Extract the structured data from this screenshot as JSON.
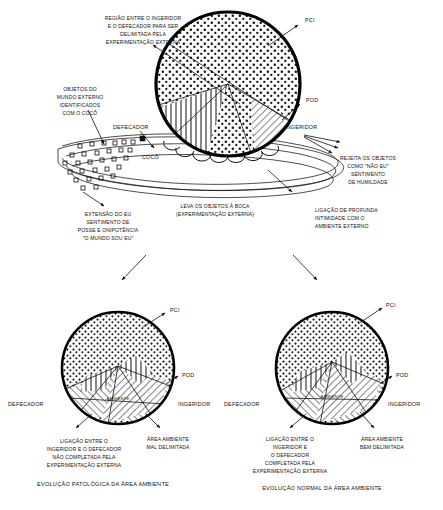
{
  "figure": {
    "title_top": "",
    "panels": [
      {
        "id": "top",
        "name": "top-diagram",
        "labels": {
          "pci": "PCI",
          "pod": "POD",
          "ingeridor": "INGERIDOR",
          "defecador": "DEFECADOR",
          "coco": "COCÔ"
        },
        "annotations": [
          {
            "id": "regiao-entre",
            "lines": [
              "REGIÃO ENTRE O INGERIDOR",
              "E O DEFECADOR PARA SER",
              "DELIMITADA PELA",
              "EXPERIMENTAÇÃO EXTERNA"
            ]
          },
          {
            "id": "objetos-mundo-externo",
            "lines": [
              "OBJETOS DO",
              "MUNDO EXTERNO",
              "IDENTIFICADOS",
              "COM O COCÔ"
            ]
          },
          {
            "id": "rejeita-objetos",
            "lines": [
              "REJEITA OS OBJETOS",
              "COMO \"NÃO EU\"",
              "SENTIMENTO",
              "DE HUMILDADE"
            ]
          },
          {
            "id": "extensao-do-eu",
            "lines": [
              "EXTENSÃO DO EU",
              "SENTIMENTO DE",
              "POSSE E ONIPOTÊNCIA",
              "\"O MUNDO SOU EU\""
            ]
          },
          {
            "id": "leva-objetos-boca",
            "lines": [
              "LEVA OS OBJETOS À BOCA",
              "(EXPERIMENTAÇÃO EXTERNA)"
            ]
          },
          {
            "id": "ligacao-profunda",
            "lines": [
              "LIGAÇÃO DE PROFUNDA",
              "INTIMIDADE COM O",
              "AMBIENTE EXTERNO"
            ]
          }
        ]
      },
      {
        "id": "bottom-left",
        "name": "pathological-diagram",
        "labels": {
          "pci": "PCI",
          "pod": "POD",
          "ingeridor": "INGERIDOR",
          "defecador": "DEFECADOR",
          "ambiente": "AMBIENTE"
        },
        "annotations": [
          {
            "id": "ligacao-nao-completada",
            "lines": [
              "LIGAÇÃO ENTRE O",
              "INGERIDOR E O DEFECADOR",
              "NÃO COMPLETADA  PELA",
              "EXPERIMENTAÇÃO EXTERNA"
            ]
          },
          {
            "id": "area-mal-delimitada",
            "lines": [
              "ÁREA AMBIENTE",
              "MAL DELIMITADA"
            ]
          }
        ],
        "caption": "EVOLUÇÃO PATOLÓGICA DA ÁREA AMBIENTE"
      },
      {
        "id": "bottom-right",
        "name": "normal-diagram",
        "labels": {
          "pci": "PCI",
          "pod": "POD",
          "ingeridor": "INGERIDOR",
          "defecador": "DEFECADOR",
          "ambiente": "AMBIENTE"
        },
        "annotations": [
          {
            "id": "ligacao-completada",
            "lines": [
              "LIGAÇÃO ENTRE O",
              "INGERIDOR E",
              "O DEFECADOR",
              "COMPLETADA PELA",
              "EXPERIMENTAÇÃO EXTERNA"
            ]
          },
          {
            "id": "area-bem-delimitada",
            "lines": [
              "ÁREA AMBIENTE",
              "BEM DELIMITADA"
            ]
          }
        ],
        "caption": "EVOLUÇÃO NORMAL DA ÁREA AMBIENTE"
      }
    ]
  },
  "colors": {
    "ink": "#111111",
    "rim": "#000000",
    "paper": "#ffffff"
  }
}
